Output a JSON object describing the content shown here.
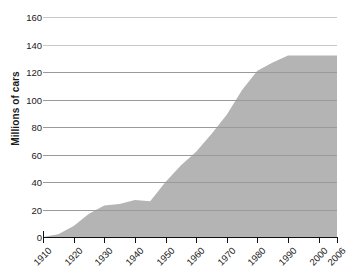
{
  "chart_data": {
    "type": "area",
    "title": "",
    "xlabel": "",
    "ylabel": "Millions of cars",
    "xlim": [
      1910,
      2006
    ],
    "ylim": [
      0,
      160
    ],
    "grid": true,
    "legend": "none",
    "fill_color": "#b4b4b4",
    "gridline_color": "#9a9a9a",
    "axis_color": "#111111",
    "x_tick_labels": [
      "1910",
      "1920",
      "1930",
      "1940",
      "1950",
      "1960",
      "1970",
      "1980",
      "1990",
      "2000",
      "2006"
    ],
    "y_tick_labels": [
      "0",
      "20",
      "40",
      "60",
      "80",
      "100",
      "120",
      "140",
      "160"
    ],
    "x": [
      1910,
      1915,
      1920,
      1925,
      1930,
      1935,
      1940,
      1945,
      1950,
      1955,
      1960,
      1965,
      1970,
      1975,
      1980,
      1985,
      1990,
      1995,
      2000,
      2006
    ],
    "values": [
      0,
      2,
      8,
      17,
      23,
      24,
      27,
      26,
      40,
      52,
      62,
      75,
      89,
      107,
      121,
      127,
      132,
      132,
      132,
      132
    ],
    "series": [
      {
        "name": "Cars",
        "values": [
          0,
          2,
          8,
          17,
          23,
          24,
          27,
          26,
          40,
          52,
          62,
          75,
          89,
          107,
          121,
          127,
          132,
          132,
          132,
          132
        ]
      }
    ]
  }
}
